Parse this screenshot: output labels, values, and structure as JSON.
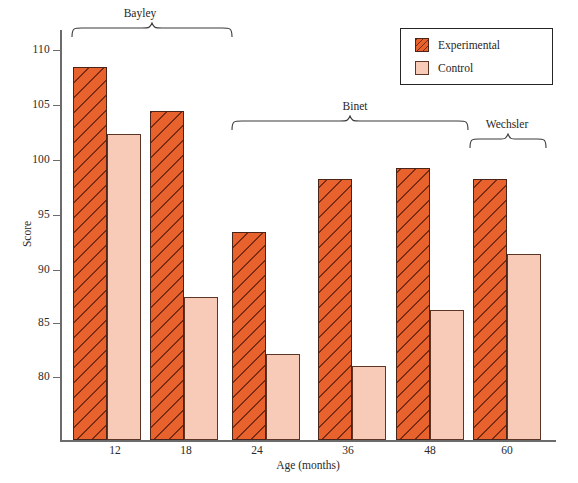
{
  "chart_data": {
    "type": "bar",
    "title": "",
    "xlabel": "Age (months)",
    "ylabel": "Score",
    "categories": [
      "12",
      "18",
      "24",
      "36",
      "48",
      "60"
    ],
    "series": [
      {
        "name": "Experimental",
        "color": "#e8622e",
        "values": [
          110.9,
          106.9,
          95.9,
          100.7,
          101.7,
          100.7
        ]
      },
      {
        "name": "Control",
        "color": "#f7cbb8",
        "values": [
          104.8,
          90.0,
          84.8,
          83.7,
          88.8,
          93.9
        ]
      }
    ],
    "ylim": [
      77.0,
      112.5
    ],
    "yticks": [
      80,
      85,
      90,
      95,
      100,
      105,
      110
    ],
    "ytick_labels": [
      "80",
      "85",
      "90",
      "95",
      "100",
      "105",
      "110"
    ],
    "grid": false,
    "legend_position": "top-right",
    "annotations": [
      {
        "label": "Bayley",
        "spans": [
          "12",
          "18"
        ]
      },
      {
        "label": "Binet",
        "spans": [
          "24",
          "36",
          "48"
        ]
      },
      {
        "label": "Wechsler",
        "spans": [
          "60"
        ]
      }
    ]
  },
  "legend": {
    "items": [
      {
        "label": "Experimental",
        "swatch": "hatched-orange-swatch"
      },
      {
        "label": "Control",
        "swatch": "solid-pink-swatch"
      }
    ]
  },
  "axes": {
    "y_title": "Score",
    "x_title": "Age (months)",
    "y_ticks": [
      "110",
      "105",
      "100",
      "95",
      "90",
      "85",
      "80"
    ],
    "x_ticks": [
      "12",
      "18",
      "24",
      "36",
      "48",
      "60"
    ]
  },
  "brackets": {
    "bayley": "Bayley",
    "binet": "Binet",
    "wechsler": "Wechsler"
  }
}
